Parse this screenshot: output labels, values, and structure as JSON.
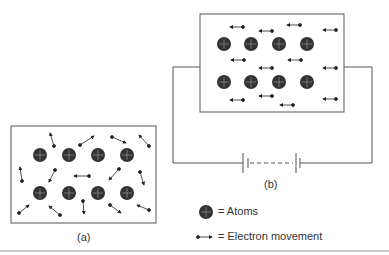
{
  "figure": {
    "panel_a": {
      "label": "(a)",
      "description": "Random electron movement, no applied voltage"
    },
    "panel_b": {
      "label": "(b)",
      "description": "Directed electron movement with battery applied"
    },
    "legend": [
      {
        "icon": "atom-icon",
        "text": "= Atoms"
      },
      {
        "icon": "electron-arrow-icon",
        "text": "= Electron movement"
      }
    ]
  }
}
